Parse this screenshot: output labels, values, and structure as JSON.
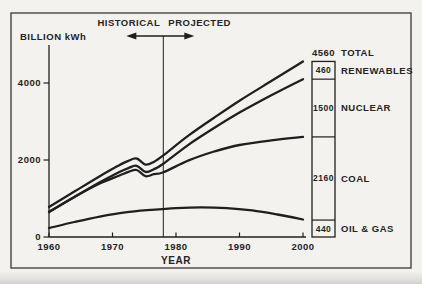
{
  "header": {
    "historical_label": "HISTORICAL",
    "projected_label": "PROJECTED"
  },
  "axes": {
    "y_axis_title": "BILLION kWh",
    "x_axis_title": "YEAR",
    "y_ticks": [
      4000,
      2000,
      0
    ],
    "x_ticks": [
      1960,
      1970,
      1980,
      1990,
      2000
    ]
  },
  "colors": {
    "ink": "#1f1f1f",
    "text": "#242424",
    "frame": "#454545",
    "background": "#f3f2ef"
  },
  "chart_data": {
    "type": "line",
    "title": "",
    "xlabel": "YEAR",
    "ylabel": "BILLION kWh",
    "xlim": [
      1960,
      2000
    ],
    "ylim": [
      0,
      4800
    ],
    "grid": false,
    "divider_year": 1978,
    "divider_note": "vertical line separating historical data from projections",
    "series": [
      {
        "name": "Total",
        "points": [
          [
            1960,
            780
          ],
          [
            1964,
            1180
          ],
          [
            1968,
            1580
          ],
          [
            1971,
            1860
          ],
          [
            1972.5,
            1980
          ],
          [
            1973.8,
            2040
          ],
          [
            1975.2,
            1880
          ],
          [
            1976.5,
            1950
          ],
          [
            1978,
            2120
          ],
          [
            1982,
            2640
          ],
          [
            1986,
            3100
          ],
          [
            1990,
            3540
          ],
          [
            1995,
            4050
          ],
          [
            2000,
            4560
          ]
        ]
      },
      {
        "name": "Oil & Gas + Coal + Nuclear (cumulative)",
        "points": [
          [
            1960,
            650
          ],
          [
            1964,
            1040
          ],
          [
            1968,
            1420
          ],
          [
            1971,
            1680
          ],
          [
            1972.5,
            1790
          ],
          [
            1973.8,
            1850
          ],
          [
            1975.2,
            1690
          ],
          [
            1976.5,
            1760
          ],
          [
            1978,
            1900
          ],
          [
            1982,
            2400
          ],
          [
            1986,
            2830
          ],
          [
            1990,
            3230
          ],
          [
            1995,
            3680
          ],
          [
            2000,
            4100
          ]
        ]
      },
      {
        "name": "Oil & Gas + Coal (cumulative)",
        "points": [
          [
            1960,
            650
          ],
          [
            1964,
            1040
          ],
          [
            1968,
            1390
          ],
          [
            1971,
            1590
          ],
          [
            1972.5,
            1690
          ],
          [
            1973.8,
            1740
          ],
          [
            1975.2,
            1580
          ],
          [
            1976.5,
            1630
          ],
          [
            1978,
            1680
          ],
          [
            1982,
            1990
          ],
          [
            1986,
            2220
          ],
          [
            1990,
            2390
          ],
          [
            1995,
            2510
          ],
          [
            2000,
            2600
          ]
        ]
      },
      {
        "name": "Oil & Gas",
        "points": [
          [
            1960,
            230
          ],
          [
            1964,
            390
          ],
          [
            1968,
            530
          ],
          [
            1972,
            640
          ],
          [
            1976,
            705
          ],
          [
            1980,
            750
          ],
          [
            1984,
            770
          ],
          [
            1988,
            750
          ],
          [
            1992,
            690
          ],
          [
            1996,
            585
          ],
          [
            2000,
            455
          ]
        ]
      }
    ],
    "end_bar": {
      "total_value": "4560",
      "total_label": "TOTAL",
      "segments_bottom_up": [
        {
          "value": 440,
          "value_label": "440",
          "label": "OIL & GAS"
        },
        {
          "value": 2160,
          "value_label": "2160",
          "label": "COAL"
        },
        {
          "value": 1500,
          "value_label": "1500",
          "label": "NUCLEAR"
        },
        {
          "value": 460,
          "value_label": "460",
          "label": "RENEWABLES"
        }
      ]
    }
  }
}
